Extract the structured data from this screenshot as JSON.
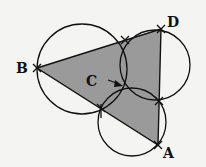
{
  "diagram": {
    "type": "geometric-construction",
    "colors": {
      "background": "#f4f4f2",
      "triangle_fill": "#9a9a9a",
      "stroke": "#111111"
    },
    "points": {
      "A": {
        "label": "A",
        "x": 158,
        "y": 145
      },
      "B": {
        "label": "B",
        "x": 37,
        "y": 68
      },
      "D": {
        "label": "D",
        "x": 161,
        "y": 29
      },
      "C": {
        "label": "C",
        "x": 128,
        "y": 89
      }
    },
    "triangle": [
      "B",
      "D",
      "A"
    ],
    "circles": [
      {
        "name": "circle-left",
        "cx": 82,
        "cy": 69,
        "r": 45
      },
      {
        "name": "circle-upper-right",
        "cx": 155,
        "cy": 65,
        "r": 35
      },
      {
        "name": "circle-bottom",
        "cx": 132,
        "cy": 122,
        "r": 34
      }
    ],
    "labels": {
      "A": "A",
      "B": "B",
      "C": "C",
      "D": "D"
    }
  }
}
